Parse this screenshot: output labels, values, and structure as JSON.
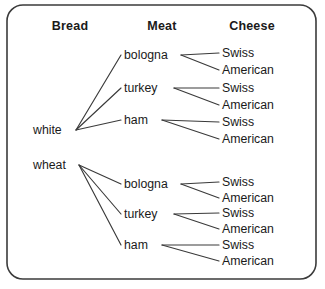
{
  "panel": {
    "name": "sandwich-combination-tree-diagram"
  },
  "headers": [
    {
      "label": "Bread",
      "x": 70,
      "y": 30
    },
    {
      "label": "Meat",
      "x": 162,
      "y": 30
    },
    {
      "label": "Cheese",
      "x": 252,
      "y": 30
    }
  ],
  "bread_nodes": [
    {
      "label": "white",
      "x": 33,
      "y": 134,
      "origin_x": 76,
      "origin_y": 130
    },
    {
      "label": "wheat",
      "x": 33,
      "y": 169,
      "origin_x": 79,
      "origin_y": 165
    }
  ],
  "meat_nodes": [
    {
      "label": "bologna",
      "x": 124,
      "y": 59,
      "anchor_x": 121,
      "anchor_y": 55,
      "fan_x": 181,
      "fan_y": 55,
      "bread": "white"
    },
    {
      "label": "turkey",
      "x": 124,
      "y": 92,
      "anchor_x": 121,
      "anchor_y": 88,
      "fan_x": 174,
      "fan_y": 88,
      "bread": "white"
    },
    {
      "label": "ham",
      "x": 124,
      "y": 124,
      "anchor_x": 121,
      "anchor_y": 120,
      "fan_x": 162,
      "fan_y": 120,
      "bread": "white"
    },
    {
      "label": "bologna",
      "x": 124,
      "y": 188,
      "anchor_x": 121,
      "anchor_y": 184,
      "fan_x": 181,
      "fan_y": 184,
      "bread": "wheat"
    },
    {
      "label": "turkey",
      "x": 124,
      "y": 218,
      "anchor_x": 121,
      "anchor_y": 214,
      "fan_x": 174,
      "fan_y": 214,
      "bread": "wheat"
    },
    {
      "label": "ham",
      "x": 124,
      "y": 249,
      "anchor_x": 121,
      "anchor_y": 245,
      "fan_x": 162,
      "fan_y": 245,
      "bread": "wheat"
    }
  ],
  "cheese_nodes": [
    {
      "label": "Swiss",
      "x": 222,
      "y": 57,
      "target_x": 219,
      "target_y": 53,
      "meat": "bologna",
      "bread": "white"
    },
    {
      "label": "American",
      "x": 222,
      "y": 74,
      "target_x": 219,
      "target_y": 70,
      "meat": "bologna",
      "bread": "white"
    },
    {
      "label": "Swiss",
      "x": 222,
      "y": 92,
      "target_x": 219,
      "target_y": 88,
      "meat": "turkey",
      "bread": "white"
    },
    {
      "label": "American",
      "x": 222,
      "y": 109,
      "target_x": 219,
      "target_y": 105,
      "meat": "turkey",
      "bread": "white"
    },
    {
      "label": "Swiss",
      "x": 222,
      "y": 126,
      "target_x": 219,
      "target_y": 122,
      "meat": "ham",
      "bread": "white"
    },
    {
      "label": "American",
      "x": 222,
      "y": 143,
      "target_x": 219,
      "target_y": 139,
      "meat": "ham",
      "bread": "white"
    },
    {
      "label": "Swiss",
      "x": 222,
      "y": 186,
      "target_x": 219,
      "target_y": 182,
      "meat": "bologna",
      "bread": "wheat"
    },
    {
      "label": "American",
      "x": 222,
      "y": 202,
      "target_x": 219,
      "target_y": 198,
      "meat": "bologna",
      "bread": "wheat"
    },
    {
      "label": "Swiss",
      "x": 222,
      "y": 217,
      "target_x": 219,
      "target_y": 213,
      "meat": "turkey",
      "bread": "wheat"
    },
    {
      "label": "American",
      "x": 222,
      "y": 233,
      "target_x": 219,
      "target_y": 229,
      "meat": "turkey",
      "bread": "wheat"
    },
    {
      "label": "Swiss",
      "x": 222,
      "y": 249,
      "target_x": 219,
      "target_y": 245,
      "meat": "ham",
      "bread": "wheat"
    },
    {
      "label": "American",
      "x": 222,
      "y": 265,
      "target_x": 219,
      "target_y": 261,
      "meat": "ham",
      "bread": "wheat"
    }
  ],
  "colors": {
    "stroke": "#3a3a3a",
    "border": "#3b3b3b",
    "text": "#1a1a1a",
    "background": "#ffffff"
  },
  "geometry": {
    "panel_x": 7,
    "panel_y": 5,
    "panel_w": 309,
    "panel_h": 274,
    "panel_radius": 16
  }
}
